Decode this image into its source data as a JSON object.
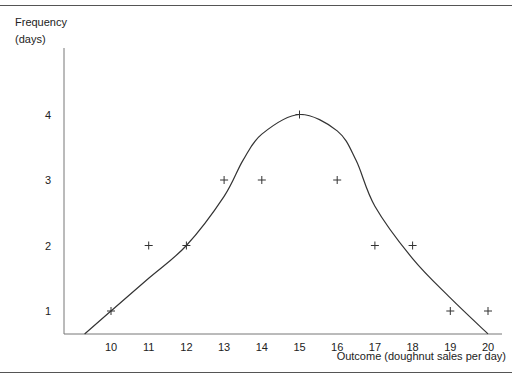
{
  "chart_data": {
    "type": "scatter",
    "title": "",
    "xlabel": "Outcome (doughnut sales per day)",
    "ylabel": "Frequency (days)",
    "ylabel_lines": [
      "Frequency",
      "(days)"
    ],
    "x_ticks": [
      10,
      11,
      12,
      13,
      14,
      15,
      16,
      17,
      18,
      19,
      20
    ],
    "y_ticks": [
      1,
      2,
      3,
      4
    ],
    "xlim": [
      8.6,
      20.4
    ],
    "ylim": [
      0.65,
      5
    ],
    "grid": false,
    "legend": null,
    "series": [
      {
        "name": "Observed frequency",
        "marker": "plus",
        "x": [
          10,
          11,
          12,
          13,
          14,
          15,
          16,
          17,
          18,
          19,
          20
        ],
        "y": [
          1,
          2,
          2,
          3,
          3,
          4,
          3,
          2,
          2,
          1,
          1
        ]
      },
      {
        "name": "Fitted curve",
        "type": "line",
        "smooth": true,
        "x": [
          9.3,
          10,
          11,
          12,
          13,
          13.5,
          14,
          15,
          16,
          16.5,
          17,
          18,
          19,
          20
        ],
        "y": [
          0.65,
          1.0,
          1.5,
          2.0,
          2.75,
          3.3,
          3.7,
          4.0,
          3.75,
          3.3,
          2.6,
          1.8,
          1.2,
          0.65
        ]
      }
    ]
  }
}
